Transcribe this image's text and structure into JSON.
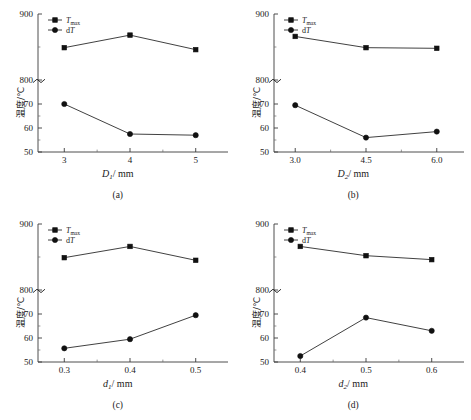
{
  "figure": {
    "y_axis_label": "温度/℃",
    "legend": [
      {
        "key": "tmax",
        "label": "T",
        "sub": "max",
        "marker": "square"
      },
      {
        "key": "dt",
        "label": "dT",
        "sub": "",
        "marker": "circle"
      }
    ],
    "axis_break_symbol": "≈",
    "y_upper_ticks": [
      "900",
      "800"
    ],
    "y_lower_ticks": [
      "70",
      "60",
      "50"
    ]
  },
  "panels": [
    {
      "caption": "(a)",
      "xlabel_main": "D",
      "xlabel_sub": "1",
      "xlabel_unit": "/ mm",
      "chart_data": {
        "type": "line",
        "title": "",
        "xlabel": "D1 / mm",
        "ylabel": "温度/℃",
        "x": [
          3,
          4,
          5
        ],
        "xticklabels": [
          "3",
          "4",
          "5"
        ],
        "xlim": [
          2.6,
          5.4
        ],
        "grid": false,
        "legend_position": "top-left",
        "axis_break": true,
        "y_upper_range": [
          800,
          900
        ],
        "y_lower_range": [
          50,
          75
        ],
        "series": [
          {
            "name": "Tmax",
            "marker": "square",
            "axis": "upper",
            "values": [
              849,
              868,
              846
            ]
          },
          {
            "name": "dT",
            "marker": "circle",
            "axis": "lower",
            "values": [
              70.0,
              57.5,
              57.0
            ]
          }
        ]
      }
    },
    {
      "caption": "(b)",
      "xlabel_main": "D",
      "xlabel_sub": "2",
      "xlabel_unit": "/ mm",
      "chart_data": {
        "type": "line",
        "title": "",
        "xlabel": "D2 / mm",
        "ylabel": "温度/℃",
        "x": [
          3.0,
          4.5,
          6.0
        ],
        "xticklabels": [
          "3.0",
          "4.5",
          "6.0"
        ],
        "xlim": [
          2.55,
          6.45
        ],
        "grid": false,
        "legend_position": "top-left",
        "axis_break": true,
        "y_upper_range": [
          800,
          900
        ],
        "y_lower_range": [
          50,
          75
        ],
        "series": [
          {
            "name": "Tmax",
            "marker": "square",
            "axis": "upper",
            "values": [
              866,
              849,
              848
            ]
          },
          {
            "name": "dT",
            "marker": "circle",
            "axis": "lower",
            "values": [
              69.5,
              56.0,
              58.5
            ]
          }
        ]
      }
    },
    {
      "caption": "(c)",
      "xlabel_main": "d",
      "xlabel_sub": "1",
      "xlabel_unit": "/ mm",
      "chart_data": {
        "type": "line",
        "title": "",
        "xlabel": "d1 / mm",
        "ylabel": "温度/℃",
        "x": [
          0.3,
          0.4,
          0.5
        ],
        "xticklabels": [
          "0.3",
          "0.4",
          "0.5"
        ],
        "xlim": [
          0.26,
          0.54
        ],
        "grid": false,
        "legend_position": "top-left",
        "axis_break": true,
        "y_upper_range": [
          800,
          900
        ],
        "y_lower_range": [
          50,
          75
        ],
        "series": [
          {
            "name": "Tmax",
            "marker": "square",
            "axis": "upper",
            "values": [
              849,
              866,
              845
            ]
          },
          {
            "name": "dT",
            "marker": "circle",
            "axis": "lower",
            "values": [
              55.7,
              59.5,
              69.5
            ]
          }
        ]
      }
    },
    {
      "caption": "(d)",
      "xlabel_main": "d",
      "xlabel_sub": "2",
      "xlabel_unit": "/ mm",
      "chart_data": {
        "type": "line",
        "title": "",
        "xlabel": "d2 / mm",
        "ylabel": "温度/℃",
        "x": [
          0.4,
          0.5,
          0.6
        ],
        "xticklabels": [
          "0.4",
          "0.5",
          "0.6"
        ],
        "xlim": [
          0.36,
          0.64
        ],
        "grid": false,
        "legend_position": "top-left",
        "axis_break": true,
        "y_upper_range": [
          800,
          900
        ],
        "y_lower_range": [
          50,
          75
        ],
        "series": [
          {
            "name": "Tmax",
            "marker": "square",
            "axis": "upper",
            "values": [
              866,
              852,
              846
            ]
          },
          {
            "name": "dT",
            "marker": "circle",
            "axis": "lower",
            "values": [
              52.5,
              68.5,
              63.0
            ]
          }
        ]
      }
    }
  ]
}
